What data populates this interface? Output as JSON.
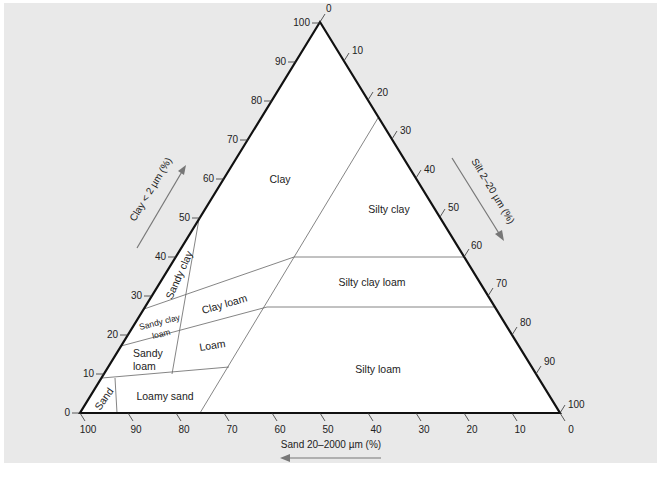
{
  "figure": {
    "type": "soil-texture-triangle",
    "background": "#e9e9e9",
    "triangle_fill": "#ffffff",
    "edge_color": "#111111",
    "boundary_color": "#555555"
  },
  "axes": {
    "clay": {
      "title": "Clay < 2 µm (%)",
      "ticks": [
        "0",
        "10",
        "20",
        "30",
        "40",
        "50",
        "60",
        "70",
        "80",
        "90",
        "100"
      ]
    },
    "silt": {
      "title": "Silt 2–20 µm (%)",
      "ticks": [
        "0",
        "10",
        "20",
        "30",
        "40",
        "50",
        "60",
        "70",
        "80",
        "90",
        "100"
      ]
    },
    "sand": {
      "title": "Sand 20–2000 µm (%)",
      "ticks": [
        "100",
        "90",
        "80",
        "70",
        "60",
        "50",
        "40",
        "30",
        "20",
        "10",
        "0"
      ]
    }
  },
  "regions": {
    "clay": "Clay",
    "silty_clay": "Silty clay",
    "sandy_clay": "Sandy clay",
    "clay_loam": "Clay loam",
    "sandy_clay_loam_1": "Sandy clay",
    "sandy_clay_loam_2": "loam",
    "silty_clay_loam": "Silty clay loam",
    "sandy_loam_1": "Sandy",
    "sandy_loam_2": "loam",
    "loam": "Loam",
    "silty_loam": "Silty loam",
    "sand": "Sand",
    "loamy_sand": "Loamy sand"
  }
}
